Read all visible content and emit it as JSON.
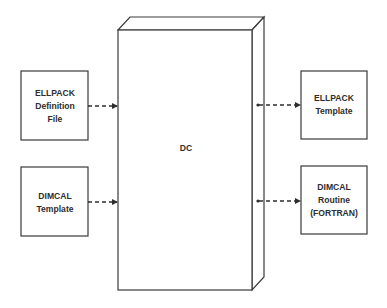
{
  "diagram": {
    "center": {
      "label": "DC"
    },
    "inputs": [
      {
        "id": "ellpack-definition-file",
        "lines": [
          "ELLPACK",
          "Definition",
          "File"
        ]
      },
      {
        "id": "dimcal-template-input",
        "lines": [
          "DIMCAL",
          "Template"
        ]
      }
    ],
    "outputs": [
      {
        "id": "ellpack-template",
        "lines": [
          "ELLPACK",
          "Template"
        ]
      },
      {
        "id": "dimcal-routine",
        "lines": [
          "DIMCAL",
          "Routine",
          "(FORTRAN)"
        ]
      }
    ],
    "edges": [
      {
        "from": "ellpack-definition-file",
        "to": "DC",
        "style": "dashed-arrow"
      },
      {
        "from": "dimcal-template-input",
        "to": "DC",
        "style": "dashed-arrow"
      },
      {
        "from": "DC",
        "to": "ellpack-template",
        "style": "dashed-arrow"
      },
      {
        "from": "DC",
        "to": "dimcal-routine",
        "style": "dashed-arrow"
      }
    ]
  }
}
